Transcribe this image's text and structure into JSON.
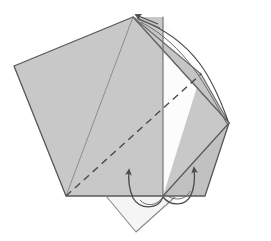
{
  "figure": {
    "kind": "origami-fold-diagram",
    "title": "",
    "caption": "",
    "background_color": "#ffffff",
    "canvas": {
      "width": 271,
      "height": 241
    }
  },
  "colors": {
    "paper_front_gray": "#c8c8c8",
    "paper_front_gray_dark": "#bdbdbd",
    "paper_front_gray_mid": "#c2c2c2",
    "paper_back_white": "#ffffff",
    "paper_back_shadow": "#f0f0f0",
    "outline": "#58585a",
    "outline_soft": "#7a7a7d",
    "crease_dashed": "#4a4a4c",
    "arrow_stroke": "#4a4a4c"
  },
  "geometry": {
    "apex": {
      "x": 133,
      "y": 17
    },
    "left_vertex": {
      "x": 14,
      "y": 66
    },
    "bottom_left_vertex": {
      "x": 66,
      "y": 196
    },
    "bottom_right_vertex": {
      "x": 205,
      "y": 196
    },
    "right_vertex": {
      "x": 229,
      "y": 123
    },
    "vertical_crease_x": 163,
    "white_flap_tip": {
      "x": 136,
      "y": 232
    }
  },
  "shapes": [
    {
      "id": "left-panel",
      "name": "left-gray-panel",
      "fill": "#c8c8c8",
      "points": "133,17 14,66 66,196 163,196 163,17"
    },
    {
      "id": "bottom-white-flap",
      "name": "bottom-white-flap",
      "fill": "#f4f4f4",
      "points": "106,196 136,232 176,196"
    },
    {
      "id": "center-white-panel",
      "name": "center-white-back-panel",
      "fill": "#fbfbfb",
      "points": "163,17 200,74 163,196"
    },
    {
      "id": "right-upper-flap",
      "name": "right-upper-gray-flap",
      "fill": "#c4c4c4",
      "points": "133,17 229,123 200,74"
    },
    {
      "id": "right-outer-panel",
      "name": "right-outer-gray-panel",
      "fill": "#c8c8c8",
      "points": "133,17 229,123 205,196 163,196"
    },
    {
      "id": "right-lower-flap",
      "name": "right-lower-gray-flap",
      "fill": "#c0c0c0",
      "points": "163,196 229,123 205,196"
    }
  ],
  "creases": [
    {
      "id": "crease-apex-to-bottom-left",
      "name": "solid-crease-apex-to-bottom-left",
      "style": "solid",
      "from": {
        "x": 133,
        "y": 17
      },
      "to": {
        "x": 66,
        "y": 196
      }
    },
    {
      "id": "crease-vertical",
      "name": "solid-crease-vertical-center",
      "style": "solid",
      "from": {
        "x": 163,
        "y": 17
      },
      "to": {
        "x": 163,
        "y": 196
      }
    },
    {
      "id": "crease-valley-dashed",
      "name": "dashed-valley-fold-line",
      "style": "dashed",
      "from": {
        "x": 66,
        "y": 196
      },
      "to": {
        "x": 200,
        "y": 74
      }
    },
    {
      "id": "crease-white-panel-diagonal",
      "name": "solid-crease-white-panel-diagonal",
      "style": "solid",
      "from": {
        "x": 229,
        "y": 123
      },
      "to": {
        "x": 163,
        "y": 196
      }
    }
  ],
  "arrows": [
    {
      "id": "arrow-top",
      "name": "fold-arrow-top-apex",
      "direction": "up-left",
      "description": "straight arrow pointing to apex"
    },
    {
      "id": "arrow-bottom-left",
      "name": "fold-arrow-bottom-left",
      "direction": "up",
      "description": "curved arrow sweeping up from bottom flap"
    },
    {
      "id": "arrow-bottom-right",
      "name": "fold-arrow-bottom-right",
      "direction": "up-right",
      "description": "curved arrow sweeping up on right flap"
    },
    {
      "id": "arrow-arc-right",
      "name": "fold-arc-right-sweep",
      "direction": "clockwise",
      "description": "long arc from apex sweeping to right vertex"
    }
  ],
  "labels": {
    "step_number": "",
    "annotations": []
  }
}
